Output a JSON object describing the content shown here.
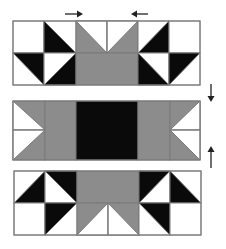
{
  "diagram": {
    "colors": {
      "black": "#0a0a0a",
      "gray": "#8c8c8c",
      "white": "#ffffff",
      "outline": "#7a7a7a",
      "arrow": "#222222"
    },
    "rows": [
      {
        "name": "top-row",
        "pressing": "toward center"
      },
      {
        "name": "middle-row",
        "pressing": "toward center"
      },
      {
        "name": "bottom-row",
        "pressing": "toward center"
      }
    ],
    "arrows": [
      {
        "name": "arrow-right-top",
        "direction": "right"
      },
      {
        "name": "arrow-left-top",
        "direction": "left"
      },
      {
        "name": "arrow-down-right",
        "direction": "down"
      },
      {
        "name": "arrow-up-right",
        "direction": "up"
      }
    ]
  }
}
